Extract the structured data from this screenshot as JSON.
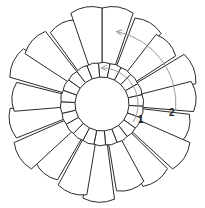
{
  "diagram": {
    "center": [
      102,
      104
    ],
    "inner_ring": {
      "cells": 22,
      "r_in": 27,
      "r_out": 41
    },
    "outer_ring": {
      "cells": 19,
      "r_in": 41,
      "r_out": 96
    },
    "stroke_color": "#2a2a2a",
    "arrow_color": "#9a9a9a",
    "labels": [
      {
        "id": "1",
        "text": "1",
        "x": 141,
        "y": 120
      },
      {
        "id": "2",
        "text": "2",
        "x": 172,
        "y": 113
      }
    ],
    "arrows": [
      {
        "label": "1",
        "from_angle": 30,
        "to_angle": -90,
        "radius": 36
      },
      {
        "label": "2",
        "from_angle": 5,
        "to_angle": -78,
        "radius": 74
      }
    ]
  }
}
